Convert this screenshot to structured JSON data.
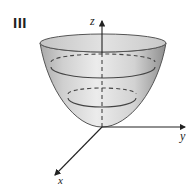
{
  "figure": {
    "panel_label": "III",
    "surface": "elliptic paraboloid opening upward",
    "axes": {
      "x_label": "x",
      "y_label": "y",
      "z_label": "z"
    },
    "level_curves": {
      "solid_rings": 2,
      "dashed_back_arcs": 2
    },
    "colors": {
      "surface_light": "#e8e8e8",
      "surface_dark": "#a8a8a8",
      "rim_fill": "#d4d4d4",
      "outline": "#444444",
      "axis": "#222222"
    }
  }
}
